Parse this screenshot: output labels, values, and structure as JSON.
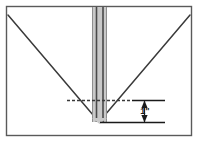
{
  "diagram": {
    "frame": {
      "name": "outer-border",
      "stroke_color": "#5a5a5a",
      "fill_color": "#ffffff",
      "x": 6,
      "y": 6,
      "width": 186,
      "height": 130
    },
    "v_groove": {
      "name": "v-cut-profile",
      "stroke_color": "#3a3a3a",
      "left_start_x": 8,
      "left_start_y": 15,
      "apex_x": 99,
      "apex_y": 122,
      "right_end_x": 190,
      "right_end_y": 15
    },
    "blade": {
      "name": "vertical-blade-strip",
      "fill_color": "#c9c9c9",
      "edge_color": "#8f8f8f",
      "line_color": "#4a4a4a",
      "left_x": 92,
      "right_x": 107,
      "top_y": 7,
      "bottom_y": 122,
      "inner_line_1_x": 96,
      "inner_line_2_x": 103
    },
    "dotted_reference_line": {
      "name": "dashed-reference-line",
      "color": "#3a3a3a",
      "x_start": 67,
      "x_end": 132,
      "y": 100,
      "dash_pattern": "3 2"
    },
    "upper_extension_line": {
      "name": "upper-extension-line",
      "color": "#1a1a1a",
      "x_start": 132,
      "x_end": 165,
      "y": 100
    },
    "lower_extension_line": {
      "name": "lower-extension-line",
      "color": "#1a1a1a",
      "x_start": 100,
      "x_end": 165,
      "y": 122
    },
    "dimension": {
      "name": "dimension-1-inch",
      "label": "1\"",
      "value": "1",
      "unit": "inch",
      "color": "#1a1a1a",
      "x": 144,
      "y_top": 100,
      "y_bottom": 122,
      "label_x": 148,
      "label_y": 114
    }
  }
}
